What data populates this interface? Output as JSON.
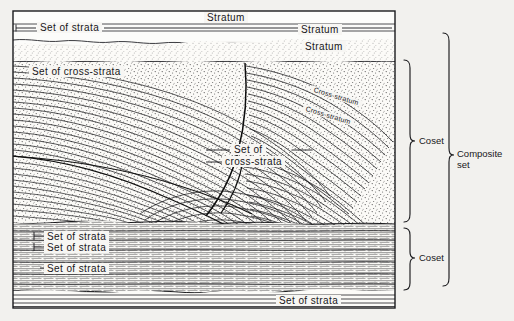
{
  "figure": {
    "background_color": "#f2f1ee",
    "ink_color": "#17171a",
    "frame": {
      "x": 13,
      "y": 11,
      "width": 382,
      "height": 297
    }
  },
  "labels": {
    "stratum_1": "Stratum",
    "stratum_2": "Stratum",
    "stratum_3": "Stratum",
    "set_of_strata_top": "Set of strata",
    "set_of_cross_strata_left": "Set of cross-strata",
    "set_of_cross_strata_mid_line1": "Set of",
    "set_of_cross_strata_mid_line2": "cross-strata",
    "cross_stratum_1": "Cross-stratum",
    "cross_stratum_2": "Cross-stratum",
    "set_of_strata_a": "Set of strata",
    "set_of_strata_b": "Set of strata",
    "set_of_strata_c": "Set of strata",
    "set_of_strata_bottom": "Set of strata"
  },
  "brackets": {
    "coset_upper": "Coset",
    "coset_lower": "Coset",
    "composite_set_line1": "Composite",
    "composite_set_line2": "set"
  }
}
